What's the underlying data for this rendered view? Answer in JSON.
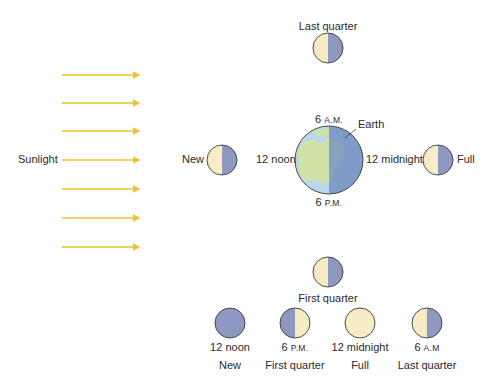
{
  "sunlight": {
    "label": "Sunlight",
    "arrow_color": "#f2c230",
    "arrow_count": 7
  },
  "colors": {
    "lit": "#f7ecc6",
    "dark": "#8e98c0",
    "outline": "#3a3a3a",
    "earth_ocean_day": "#b8d7ea",
    "earth_land_day": "#cfe3a8",
    "earth_night": "#7f9bc8"
  },
  "earth": {
    "label": "Earth",
    "top_hour": "6",
    "top_suffix": "A.M.",
    "bottom_hour": "6",
    "bottom_suffix": "P.M.",
    "left_label": "12 noon",
    "right_label": "12 midnight"
  },
  "orbit_moons": {
    "top": {
      "label": "Last quarter"
    },
    "left": {
      "label": "New"
    },
    "right": {
      "label": "Full"
    },
    "bottom": {
      "label": "First quarter"
    }
  },
  "phase_row": [
    {
      "time_hour": "12 noon",
      "time_suffix": "",
      "phase": "New"
    },
    {
      "time_hour": "6",
      "time_suffix": "P.M.",
      "phase": "First quarter"
    },
    {
      "time_hour": "12 midnight",
      "time_suffix": "",
      "phase": "Full"
    },
    {
      "time_hour": "6",
      "time_suffix": "A.M",
      "phase": "Last quarter"
    }
  ]
}
